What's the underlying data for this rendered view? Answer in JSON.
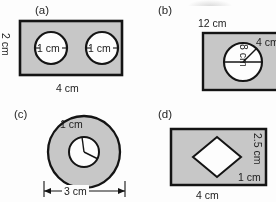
{
  "sheet": {
    "title": "",
    "fill_color": "#c9c9c9",
    "stroke_color": "#1a1a1a",
    "hole_fill": "#ffffff",
    "background": "#ffffff"
  },
  "panels": [
    {
      "id": "a",
      "label": "(a)",
      "shape": "rectangle-with-two-circular-holes",
      "width_label": "4 cm",
      "height_label": "2 cm",
      "hole_labels": [
        "1 cm",
        "1 cm"
      ],
      "hole_count": 2,
      "hole_dimension_type": "diameter"
    },
    {
      "id": "b",
      "label": "(b)",
      "shape": "rectangle-with-one-circular-hole",
      "width_label": "12 cm",
      "height_label": "8 cm",
      "hole_labels": [
        "4 cm"
      ],
      "hole_count": 1,
      "hole_dimension_type": "radius"
    },
    {
      "id": "c",
      "label": "(c)",
      "shape": "annulus",
      "width_label": "3 cm",
      "height_label": "",
      "hole_labels": [
        "1 cm"
      ],
      "hole_count": 1,
      "hole_dimension_type": "radius"
    },
    {
      "id": "d",
      "label": "(d)",
      "shape": "rectangle-with-square-hole",
      "width_label": "4 cm",
      "height_label": "2.5 cm",
      "hole_labels": [
        "1 cm"
      ],
      "hole_count": 1,
      "hole_dimension_type": "side"
    }
  ]
}
